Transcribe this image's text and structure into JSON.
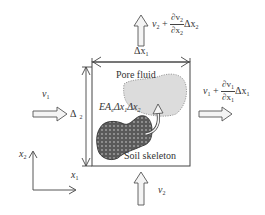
{
  "diagram": {
    "type": "control-volume schematic (soil element with pore fluid and soil skeleton)",
    "labels": {
      "top_flow": {
        "v": "v",
        "sub": "2",
        "plus": "+",
        "num": "∂v",
        "num_sub": "2",
        "den": "∂x",
        "den_sub": "2",
        "delta": "Δx",
        "delta_sub": "2"
      },
      "right_flow": {
        "v": "v",
        "sub": "1",
        "plus": "+",
        "num": "∂v",
        "num_sub": "1",
        "den": "∂x",
        "den_sub": "1",
        "delta": "Δx",
        "delta_sub": "1"
      },
      "left_flow": {
        "v": "v",
        "sub": "1"
      },
      "bottom_flow": {
        "v": "v",
        "sub": "2"
      },
      "width_dim": {
        "text": "Δx",
        "sub": "1"
      },
      "height_dim": {
        "text": "Δ",
        "sub": "2"
      },
      "pore_fluid": "Pore fluid",
      "soil_skeleton": "Soil skeleton",
      "exchange_term": {
        "E": "EA",
        "sub_e": "e",
        "dx1": "Δx",
        "sub1": "1",
        "dx2": "Δx",
        "sub2": "2"
      },
      "axis_x1": {
        "text": "x",
        "sub": "1"
      },
      "axis_x2": {
        "text": "x",
        "sub": "2"
      }
    },
    "colors": {
      "stroke": "#444444",
      "pore_fluid_fill": "#dcdcdc",
      "soil_skeleton_fill": "#5a5a5a",
      "arrow_fill": "#f4f4f4"
    }
  }
}
